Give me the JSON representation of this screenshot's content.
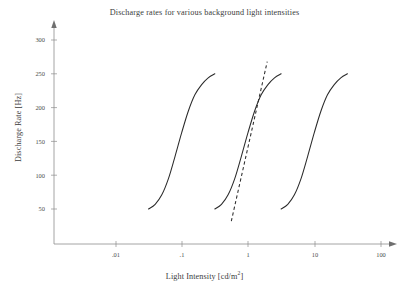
{
  "chart_data": {
    "type": "line",
    "title": "Discharge rates for various background light intensities",
    "xlabel": "Light Intensity [cd/m",
    "xlabel_sup": "2",
    "xlabel_tail": "]",
    "xlabel_full": "Light Intensity [cd/m2]",
    "ylabel": "Discharge Rate [Hz]",
    "xscale": "log",
    "yscale": "linear",
    "grid": false,
    "legend": "none",
    "xlim": [
      0.0023,
      215
    ],
    "ylim": [
      0,
      318
    ],
    "xticks": [
      ".01",
      ".1",
      "1",
      "10",
      "100"
    ],
    "xtick_values": [
      0.01,
      0.1,
      1,
      10,
      100
    ],
    "yticks": [
      "50",
      "100",
      "150",
      "200",
      "250",
      "300"
    ],
    "ytick_values": [
      50,
      100,
      150,
      200,
      250,
      300
    ],
    "series": [
      {
        "name": "curve-low-adaptation",
        "style": "solid",
        "color": "#2b2b2b",
        "x": [
          0.0316,
          0.0398,
          0.0501,
          0.0631,
          0.0794,
          0.1,
          0.126,
          0.158,
          0.2,
          0.251,
          0.316
        ],
        "values": [
          50,
          57,
          71,
          95,
          128,
          163,
          195,
          219,
          234,
          244,
          250
        ]
      },
      {
        "name": "curve-mid-adaptation",
        "style": "solid",
        "color": "#2b2b2b",
        "x": [
          0.316,
          0.398,
          0.501,
          0.631,
          0.794,
          1.0,
          1.26,
          1.58,
          2.0,
          2.51,
          3.16
        ],
        "values": [
          50,
          57,
          71,
          95,
          128,
          163,
          195,
          219,
          234,
          244,
          250
        ]
      },
      {
        "name": "curve-high-adaptation",
        "style": "solid",
        "color": "#2b2b2b",
        "x": [
          3.16,
          3.98,
          5.01,
          6.31,
          7.94,
          10.0,
          12.6,
          15.8,
          20.0,
          25.1,
          31.6
        ],
        "values": [
          50,
          57,
          71,
          95,
          128,
          163,
          195,
          219,
          234,
          244,
          250
        ]
      },
      {
        "name": "tangent-line-mid-curve",
        "style": "dashed",
        "color": "#2b2b2b",
        "x": [
          0.56,
          1.95
        ],
        "values": [
          32,
          268
        ]
      }
    ],
    "annotations": []
  }
}
